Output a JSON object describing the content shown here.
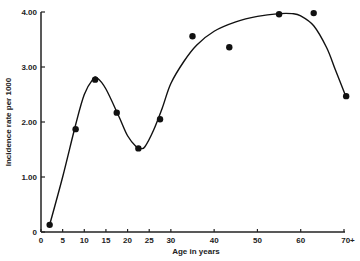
{
  "chart_data": {
    "type": "scatter",
    "title": "",
    "xlabel": "Age in years",
    "ylabel": "Incidence rate per 1000",
    "xlim": [
      0,
      70
    ],
    "ylim": [
      0,
      4.0
    ],
    "grid": false,
    "legend": null,
    "x_ticks": [
      {
        "value": 0,
        "label": "0"
      },
      {
        "value": 5,
        "label": "5"
      },
      {
        "value": 10,
        "label": "10"
      },
      {
        "value": 15,
        "label": "15"
      },
      {
        "value": 20,
        "label": "20"
      },
      {
        "value": 25,
        "label": "25"
      },
      {
        "value": 30,
        "label": "30"
      },
      {
        "value": 40,
        "label": "40"
      },
      {
        "value": 50,
        "label": "50"
      },
      {
        "value": 60,
        "label": "60"
      },
      {
        "value": 70,
        "label": "70+"
      }
    ],
    "y_ticks": [
      {
        "value": 0,
        "label": "0"
      },
      {
        "value": 1,
        "label": "1.00"
      },
      {
        "value": 2,
        "label": "2.00"
      },
      {
        "value": 3,
        "label": "3.00"
      },
      {
        "value": 4,
        "label": "4.00"
      }
    ],
    "series": [
      {
        "name": "Observed incidence",
        "style": "points",
        "x": [
          2,
          8,
          12.5,
          17.5,
          22.5,
          27.5,
          35,
          43.5,
          55,
          63,
          70.5
        ],
        "values": [
          0.13,
          1.87,
          2.77,
          2.17,
          1.52,
          2.05,
          3.56,
          3.36,
          3.96,
          3.98,
          2.47
        ]
      },
      {
        "name": "Fitted curve",
        "style": "smooth-line",
        "x": [
          2,
          5,
          8,
          10,
          12,
          13,
          15,
          18,
          20,
          22,
          23,
          24,
          26,
          28,
          30,
          33,
          36,
          40,
          45,
          50,
          55,
          58,
          60,
          63,
          66,
          68,
          70.5
        ],
        "values": [
          0.13,
          1.0,
          1.95,
          2.5,
          2.78,
          2.8,
          2.6,
          2.1,
          1.75,
          1.55,
          1.52,
          1.55,
          1.85,
          2.25,
          2.7,
          3.1,
          3.4,
          3.65,
          3.82,
          3.92,
          3.97,
          3.97,
          3.93,
          3.75,
          3.35,
          2.95,
          2.45
        ]
      }
    ]
  }
}
